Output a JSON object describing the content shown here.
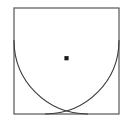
{
  "figure": {
    "kind": "geometry-diagram",
    "canvas": {
      "width": 131,
      "height": 123,
      "background": "#ffffff"
    },
    "colors": {
      "stroke": "#3a3a3a",
      "square_stroke": "#555555",
      "fill": "none",
      "marker": "#1a1a1a",
      "background": "#ffffff"
    },
    "stroke_width": 1.1,
    "square": {
      "name": "outer-square",
      "x": 14,
      "y": 8,
      "width": 105,
      "height": 106,
      "corners": {
        "top_left": [
          14,
          8
        ],
        "top_right": [
          119,
          8
        ],
        "bottom_right": [
          119,
          114
        ],
        "bottom_left": [
          14,
          114
        ]
      }
    },
    "arcs": [
      {
        "name": "arc-from-bottom-left-corner",
        "center": [
          14,
          114
        ],
        "radius": 73.5,
        "start": [
          14,
          40.5
        ],
        "end": [
          87.5,
          114
        ],
        "path": "M 14 40.5 A 73.5 73.5 0 0 0 87.5 114"
      },
      {
        "name": "arc-from-bottom-right-corner",
        "center": [
          119,
          114
        ],
        "radius": 73.5,
        "start": [
          119,
          40.5
        ],
        "end": [
          45.5,
          114
        ],
        "path": "M 119 40.5 A 73.5 73.5 0 0 1 45.5 114"
      }
    ],
    "intersection_marker": {
      "name": "arc-intersection-point",
      "x": 66.5,
      "y": 58.2,
      "size": 4.2,
      "shape": "square-dot"
    },
    "labels": []
  }
}
